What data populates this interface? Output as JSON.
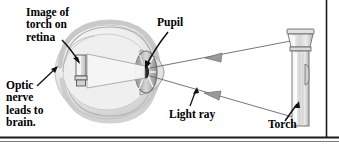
{
  "figure": {
    "background_color": "#ffffff",
    "border_color": "#1a1a1a"
  },
  "labels": {
    "image_on_retina": "Image of\ntorch on\nretina",
    "optic_nerve": "Optic\nnerve\nleads to\nbrain.",
    "pupil": "Pupil",
    "light_ray": "Light ray",
    "torch": "Torch"
  },
  "diagram": {
    "objects": [
      {
        "name": "eyeball",
        "description": "cross-section of human eye, shaded grey sphere"
      },
      {
        "name": "retina-image",
        "description": "inverted image of torch on the retina"
      },
      {
        "name": "pupil",
        "description": "dark opening at front of eye with radial iris lines"
      },
      {
        "name": "torch",
        "description": "vertical flashlight at right of figure"
      },
      {
        "name": "light-rays",
        "description": "two straight rays from torch to eye with leftward arrowheads"
      }
    ],
    "colors": {
      "eye_fill": "#e9e9e9",
      "eye_shade": "#c9c9c9",
      "torch_fill": "#e4e4e4",
      "ray_line": "#555555",
      "outline": "#3a3a3a"
    }
  }
}
